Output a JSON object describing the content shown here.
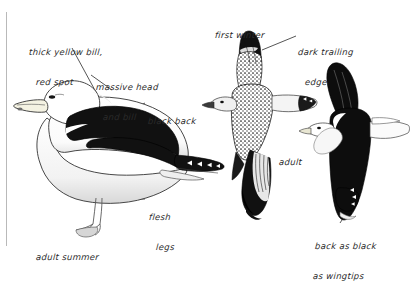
{
  "plate": {
    "title": "Great Black-backed Gull identification plate",
    "background_color": "#ffffff",
    "ink_color": "#1a1a1a",
    "rule_color": "#b9b9b9"
  },
  "annotations": [
    {
      "name": "thick-yellow-bill-red-spot",
      "lines": [
        "thick yellow bill,",
        "red spot"
      ],
      "x": 28,
      "y": 27
    },
    {
      "name": "massive-head-and-bill",
      "lines": [
        "massive head",
        "and bill"
      ],
      "x": 95,
      "y": 62
    },
    {
      "name": "black-back",
      "lines": [
        "black back"
      ],
      "x": 148,
      "y": 96
    },
    {
      "name": "flesh-legs",
      "lines": [
        "flesh",
        "legs"
      ],
      "x": 148,
      "y": 192
    },
    {
      "name": "adult-summer",
      "lines": [
        "adult summer"
      ],
      "x": 36,
      "y": 232
    },
    {
      "name": "first-winter",
      "lines": [
        "first winter"
      ],
      "x": 215,
      "y": 10
    },
    {
      "name": "dark-trailing-edge",
      "lines": [
        "dark trailing",
        "edge"
      ],
      "x": 297,
      "y": 27
    },
    {
      "name": "adult",
      "lines": [
        "adult"
      ],
      "x": 279,
      "y": 137
    },
    {
      "name": "back-as-black-as-wingtips",
      "lines": [
        "back as black",
        "as wingtips"
      ],
      "x": 314,
      "y": 221
    }
  ],
  "figures": [
    {
      "name": "standing-adult-summer-gull",
      "caption_ref": "adult-summer"
    },
    {
      "name": "first-winter-gull-in-flight",
      "caption_ref": "first-winter"
    },
    {
      "name": "adult-gull-in-flight",
      "caption_ref": "adult"
    }
  ]
}
